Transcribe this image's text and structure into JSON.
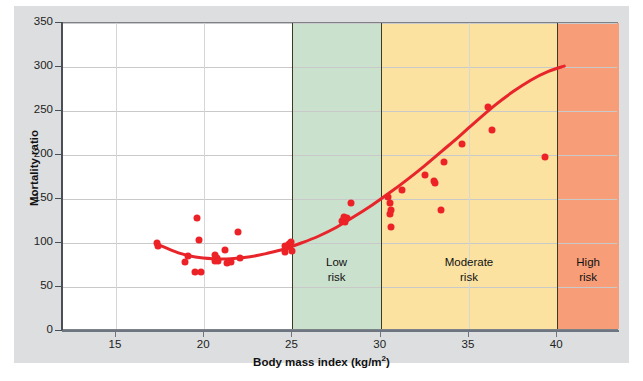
{
  "chart_data": {
    "type": "scatter",
    "title": "",
    "xlabel": "Body mass index (kg/m2)",
    "ylabel": "Mortality ratio",
    "xlim": [
      12,
      43.5
    ],
    "ylim": [
      0,
      350
    ],
    "xticks": [
      15,
      20,
      25,
      30,
      35,
      40
    ],
    "yticks": [
      0,
      50,
      100,
      150,
      200,
      250,
      300,
      350
    ],
    "grid": true,
    "legend": "none",
    "series": [
      {
        "name": "Observed mortality ratio",
        "marker_color": "#ec2227",
        "points": [
          [
            17.3,
            100
          ],
          [
            17.4,
            97
          ],
          [
            18.9,
            78
          ],
          [
            19.1,
            85
          ],
          [
            19.6,
            128
          ],
          [
            19.7,
            103
          ],
          [
            19.5,
            67
          ],
          [
            19.8,
            67
          ],
          [
            20.6,
            86
          ],
          [
            20.7,
            83
          ],
          [
            20.6,
            80
          ],
          [
            20.8,
            79
          ],
          [
            21.2,
            92
          ],
          [
            21.3,
            77
          ],
          [
            21.5,
            78
          ],
          [
            21.9,
            112
          ],
          [
            22.0,
            83
          ],
          [
            24.6,
            97
          ],
          [
            24.7,
            95
          ],
          [
            24.8,
            99
          ],
          [
            24.9,
            101
          ],
          [
            25.0,
            91
          ],
          [
            24.6,
            90
          ],
          [
            27.8,
            125
          ],
          [
            27.9,
            130
          ],
          [
            28.0,
            124
          ],
          [
            28.1,
            128
          ],
          [
            28.3,
            146
          ],
          [
            30.4,
            152
          ],
          [
            30.5,
            146
          ],
          [
            30.6,
            138
          ],
          [
            30.5,
            133
          ],
          [
            30.6,
            118
          ],
          [
            31.2,
            160
          ],
          [
            32.5,
            177
          ],
          [
            33.0,
            171
          ],
          [
            33.1,
            168
          ],
          [
            33.4,
            138
          ],
          [
            33.6,
            192
          ],
          [
            34.6,
            212
          ],
          [
            36.1,
            255
          ],
          [
            36.3,
            228
          ],
          [
            39.3,
            198
          ]
        ]
      }
    ],
    "fit_curve": {
      "name": "Fitted J-shaped trend",
      "color": "#e8252b",
      "points": [
        [
          17.3,
          99
        ],
        [
          18.5,
          89
        ],
        [
          19.5,
          84
        ],
        [
          20.5,
          82
        ],
        [
          21.5,
          82
        ],
        [
          22.5,
          84
        ],
        [
          23.5,
          88
        ],
        [
          24.5,
          93
        ],
        [
          25.5,
          100
        ],
        [
          26.5,
          108
        ],
        [
          27.5,
          118
        ],
        [
          28.5,
          130
        ],
        [
          29.5,
          143
        ],
        [
          30.5,
          157
        ],
        [
          31.5,
          172
        ],
        [
          32.5,
          188
        ],
        [
          33.5,
          205
        ],
        [
          34.5,
          222
        ],
        [
          35.5,
          240
        ],
        [
          36.5,
          257
        ],
        [
          37.5,
          272
        ],
        [
          38.5,
          285
        ],
        [
          39.5,
          295
        ],
        [
          40.4,
          301
        ]
      ]
    },
    "bands": [
      {
        "label_line1": "",
        "label_line2": "",
        "from": 12,
        "to": 25,
        "color": "#ffffff"
      },
      {
        "label_line1": "Low",
        "label_line2": "risk",
        "from": 25,
        "to": 30,
        "color": "#cae1cd"
      },
      {
        "label_line1": "Moderate",
        "label_line2": "risk",
        "from": 30,
        "to": 40,
        "color": "#fbe2a0"
      },
      {
        "label_line1": "High",
        "label_line2": "risk",
        "from": 40,
        "to": 43.5,
        "color": "#f79e79"
      }
    ]
  }
}
